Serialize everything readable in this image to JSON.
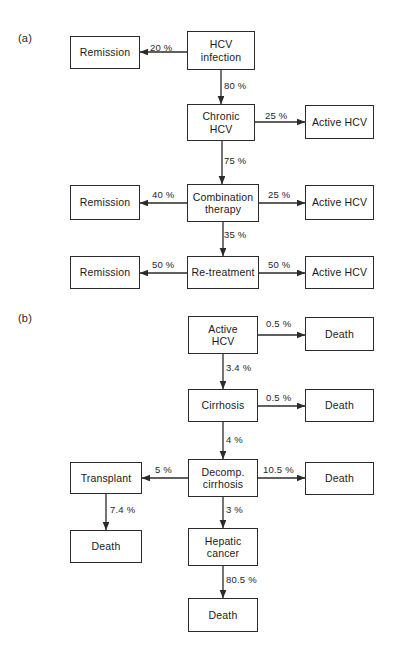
{
  "figure": {
    "panels": [
      {
        "id": "a",
        "label": "(a)",
        "nodes": [
          {
            "key": "a_remission_1",
            "text": "Remission",
            "x": 70,
            "y": 36,
            "w": 70,
            "h": 33
          },
          {
            "key": "a_hcv_infection",
            "text": "HCV\ninfection",
            "x": 187,
            "y": 31,
            "w": 68,
            "h": 39
          },
          {
            "key": "a_chronic_hcv",
            "text": "Chronic\nHCV",
            "x": 187,
            "y": 104,
            "w": 68,
            "h": 37
          },
          {
            "key": "a_active_hcv_1",
            "text": "Active HCV",
            "x": 305,
            "y": 105,
            "w": 69,
            "h": 34
          },
          {
            "key": "a_combination",
            "text": "Combination\ntherapy",
            "x": 187,
            "y": 184,
            "w": 72,
            "h": 38
          },
          {
            "key": "a_remission_2",
            "text": "Remission",
            "x": 70,
            "y": 185,
            "w": 70,
            "h": 35
          },
          {
            "key": "a_active_hcv_2",
            "text": "Active HCV",
            "x": 305,
            "y": 185,
            "w": 69,
            "h": 35
          },
          {
            "key": "a_retreatment",
            "text": "Re-treatment",
            "x": 187,
            "y": 256,
            "w": 72,
            "h": 33
          },
          {
            "key": "a_remission_3",
            "text": "Remission",
            "x": 70,
            "y": 256,
            "w": 70,
            "h": 33
          },
          {
            "key": "a_active_hcv_3",
            "text": "Active HCV",
            "x": 305,
            "y": 256,
            "w": 69,
            "h": 33
          }
        ],
        "edges": [
          {
            "key": "a_e1",
            "from": "a_hcv_infection",
            "to": "a_remission_1",
            "dir": "left",
            "label": "20 %",
            "lx": 150,
            "ly": 42
          },
          {
            "key": "a_e2",
            "from": "a_hcv_infection",
            "to": "a_chronic_hcv",
            "dir": "down",
            "label": "80 %",
            "lx": 224,
            "ly": 80
          },
          {
            "key": "a_e3",
            "from": "a_chronic_hcv",
            "to": "a_active_hcv_1",
            "dir": "right",
            "label": "25 %",
            "lx": 265,
            "ly": 110
          },
          {
            "key": "a_e4",
            "from": "a_chronic_hcv",
            "to": "a_combination",
            "dir": "down",
            "label": "75 %",
            "lx": 224,
            "ly": 155
          },
          {
            "key": "a_e5",
            "from": "a_combination",
            "to": "a_remission_2",
            "dir": "left",
            "label": "40 %",
            "lx": 152,
            "ly": 189
          },
          {
            "key": "a_e6",
            "from": "a_combination",
            "to": "a_active_hcv_2",
            "dir": "right",
            "label": "25 %",
            "lx": 268,
            "ly": 189
          },
          {
            "key": "a_e7",
            "from": "a_combination",
            "to": "a_retreatment",
            "dir": "down",
            "label": "35 %",
            "lx": 224,
            "ly": 229
          },
          {
            "key": "a_e8",
            "from": "a_retreatment",
            "to": "a_remission_3",
            "dir": "left",
            "label": "50 %",
            "lx": 152,
            "ly": 259
          },
          {
            "key": "a_e9",
            "from": "a_retreatment",
            "to": "a_active_hcv_3",
            "dir": "right",
            "label": "50 %",
            "lx": 268,
            "ly": 259
          }
        ]
      },
      {
        "id": "b",
        "label": "(b)",
        "nodes": [
          {
            "key": "b_active_hcv",
            "text": "Active\nHCV",
            "x": 188,
            "y": 316,
            "w": 70,
            "h": 38
          },
          {
            "key": "b_death_1",
            "text": "Death",
            "x": 305,
            "y": 317,
            "w": 69,
            "h": 34
          },
          {
            "key": "b_cirrhosis",
            "text": "Cirrhosis",
            "x": 188,
            "y": 389,
            "w": 70,
            "h": 33
          },
          {
            "key": "b_death_2",
            "text": "Death",
            "x": 305,
            "y": 389,
            "w": 69,
            "h": 33
          },
          {
            "key": "b_decomp",
            "text": "Decomp.\ncirrhosis",
            "x": 188,
            "y": 459,
            "w": 70,
            "h": 38
          },
          {
            "key": "b_transplant",
            "text": "Transplant",
            "x": 70,
            "y": 462,
            "w": 72,
            "h": 32
          },
          {
            "key": "b_death_3",
            "text": "Death",
            "x": 305,
            "y": 462,
            "w": 69,
            "h": 33
          },
          {
            "key": "b_death_4",
            "text": "Death",
            "x": 70,
            "y": 530,
            "w": 72,
            "h": 33
          },
          {
            "key": "b_hepatic",
            "text": "Hepatic\ncancer",
            "x": 188,
            "y": 528,
            "w": 70,
            "h": 38
          },
          {
            "key": "b_death_5",
            "text": "Death",
            "x": 188,
            "y": 598,
            "w": 70,
            "h": 34
          }
        ],
        "edges": [
          {
            "key": "b_e1",
            "from": "b_active_hcv",
            "to": "b_death_1",
            "dir": "right",
            "label": "0.5 %",
            "lx": 266,
            "ly": 318
          },
          {
            "key": "b_e2",
            "from": "b_active_hcv",
            "to": "b_cirrhosis",
            "dir": "down",
            "label": "3.4 %",
            "lx": 226,
            "ly": 362
          },
          {
            "key": "b_e3",
            "from": "b_cirrhosis",
            "to": "b_death_2",
            "dir": "right",
            "label": "0.5 %",
            "lx": 266,
            "ly": 392
          },
          {
            "key": "b_e4",
            "from": "b_cirrhosis",
            "to": "b_decomp",
            "dir": "down",
            "label": "4 %",
            "lx": 226,
            "ly": 434
          },
          {
            "key": "b_e5",
            "from": "b_decomp",
            "to": "b_transplant",
            "dir": "left",
            "label": "5 %",
            "lx": 155,
            "ly": 464
          },
          {
            "key": "b_e6",
            "from": "b_decomp",
            "to": "b_death_3",
            "dir": "right",
            "label": "10.5 %",
            "lx": 263,
            "ly": 464
          },
          {
            "key": "b_e7",
            "from": "b_transplant",
            "to": "b_death_4",
            "dir": "down",
            "label": "7.4 %",
            "lx": 110,
            "ly": 504
          },
          {
            "key": "b_e8",
            "from": "b_decomp",
            "to": "b_hepatic",
            "dir": "down",
            "label": "3 %",
            "lx": 226,
            "ly": 504
          },
          {
            "key": "b_e9",
            "from": "b_hepatic",
            "to": "b_death_5",
            "dir": "down",
            "label": "80.5 %",
            "lx": 226,
            "ly": 574
          }
        ]
      }
    ],
    "style": {
      "stroke_color": "#2b2b2b",
      "text_color": "#1a1a1a",
      "background": "#ffffff"
    }
  }
}
